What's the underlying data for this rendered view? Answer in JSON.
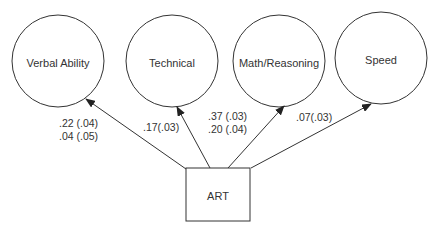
{
  "diagram": {
    "source_node": {
      "label": "ART",
      "x": 186,
      "y": 168,
      "w": 64,
      "h": 53
    },
    "target_nodes": [
      {
        "label": "Verbal Ability",
        "cx": 58,
        "cy": 61,
        "r": 46
      },
      {
        "label": "Technical",
        "cx": 172,
        "cy": 61,
        "r": 46
      },
      {
        "label": "Math/Reasoning",
        "cx": 279,
        "cy": 61,
        "r": 46
      },
      {
        "label": "Speed",
        "cx": 381,
        "cy": 58,
        "r": 46
      }
    ],
    "paths": [
      {
        "from": "ART",
        "to": "Verbal Ability",
        "coefficients": [
          ".22 (.04)",
          ".04 (.05)"
        ]
      },
      {
        "from": "ART",
        "to": "Technical",
        "coefficients": [
          ".17(.03)"
        ]
      },
      {
        "from": "ART",
        "to": "Math/Reasoning",
        "coefficients": [
          ".37 (.03)",
          ".20 (.04)"
        ]
      },
      {
        "from": "ART",
        "to": "Speed",
        "coefficients": [
          ".07(.03)"
        ]
      }
    ]
  },
  "colors": {
    "stroke": "#333333",
    "background": "#ffffff"
  }
}
